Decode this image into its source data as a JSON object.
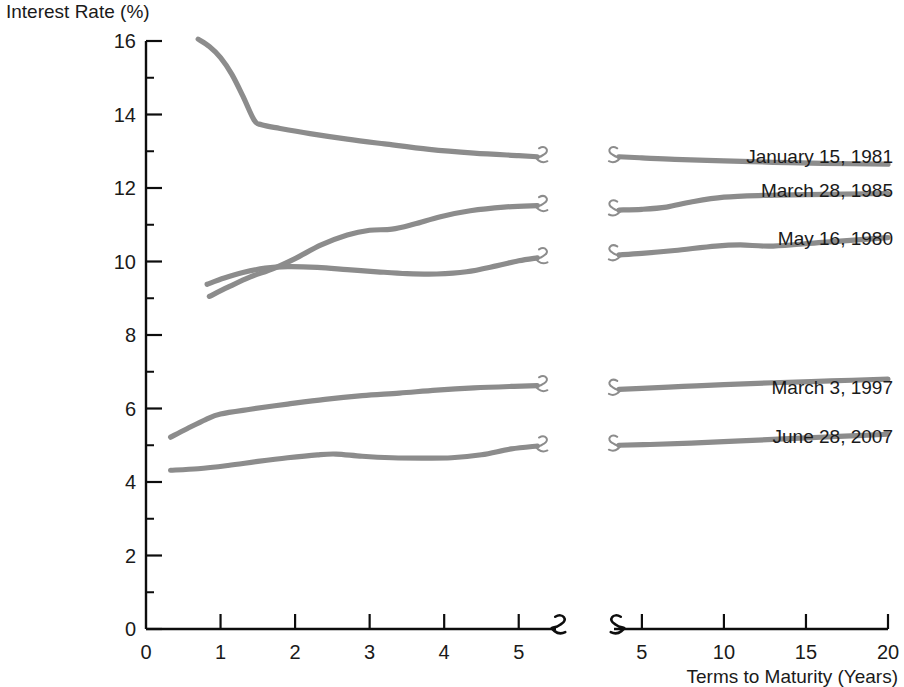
{
  "chart_data": {
    "type": "line",
    "title": "",
    "ylabel": "Interest Rate (%)",
    "xlabel": "Terms to Maturity (Years)",
    "ylim": [
      0,
      16
    ],
    "y_ticks": [
      0,
      2,
      4,
      6,
      8,
      10,
      12,
      14,
      16
    ],
    "y_tick_labels": [
      "0",
      "2",
      "4",
      "6",
      "8",
      "10",
      "12",
      "14",
      "16"
    ],
    "grid": false,
    "legend_position": "right-inline",
    "axis_break": true,
    "left_panel": {
      "xlim": [
        0,
        5.5
      ],
      "x_ticks": [
        0,
        1,
        2,
        3,
        4,
        5
      ],
      "x_tick_labels": [
        "0",
        "1",
        "2",
        "3",
        "4",
        "5"
      ]
    },
    "right_panel": {
      "xlim": [
        3.3,
        20
      ],
      "x_ticks": [
        5,
        10,
        15,
        20
      ],
      "x_tick_labels": [
        "5",
        "10",
        "15",
        "20"
      ]
    },
    "series": [
      {
        "name": "January 15, 1981",
        "color": "#8c8c8c",
        "label": "January 15, 1981",
        "left_points": [
          [
            0.7,
            16.05
          ],
          [
            0.85,
            15.85
          ],
          [
            1.0,
            15.55
          ],
          [
            1.15,
            15.1
          ],
          [
            1.3,
            14.5
          ],
          [
            1.45,
            13.85
          ],
          [
            1.55,
            13.72
          ],
          [
            1.8,
            13.62
          ],
          [
            2.2,
            13.48
          ],
          [
            2.7,
            13.33
          ],
          [
            3.2,
            13.2
          ],
          [
            3.8,
            13.05
          ],
          [
            4.4,
            12.95
          ],
          [
            5.0,
            12.88
          ],
          [
            5.25,
            12.85
          ]
        ],
        "right_points": [
          [
            3.6,
            12.85
          ],
          [
            5.0,
            12.82
          ],
          [
            7.0,
            12.78
          ],
          [
            10.0,
            12.74
          ],
          [
            13.0,
            12.7
          ],
          [
            16.0,
            12.67
          ],
          [
            20.0,
            12.65
          ]
        ]
      },
      {
        "name": "March 28, 1985",
        "color": "#8c8c8c",
        "label": "March 28, 1985",
        "left_points": [
          [
            0.85,
            9.05
          ],
          [
            1.1,
            9.3
          ],
          [
            1.4,
            9.58
          ],
          [
            1.7,
            9.8
          ],
          [
            2.0,
            10.08
          ],
          [
            2.35,
            10.45
          ],
          [
            2.7,
            10.72
          ],
          [
            3.0,
            10.85
          ],
          [
            3.3,
            10.88
          ],
          [
            3.6,
            11.02
          ],
          [
            3.95,
            11.22
          ],
          [
            4.35,
            11.38
          ],
          [
            4.8,
            11.48
          ],
          [
            5.25,
            11.52
          ]
        ],
        "right_points": [
          [
            3.6,
            11.4
          ],
          [
            5.0,
            11.42
          ],
          [
            6.5,
            11.48
          ],
          [
            8.0,
            11.62
          ],
          [
            10.0,
            11.75
          ],
          [
            12.5,
            11.8
          ],
          [
            15.0,
            11.82
          ],
          [
            20.0,
            11.85
          ]
        ]
      },
      {
        "name": "May 16, 1980",
        "color": "#8c8c8c",
        "label": "May 16, 1980",
        "left_points": [
          [
            0.82,
            9.38
          ],
          [
            1.05,
            9.55
          ],
          [
            1.3,
            9.7
          ],
          [
            1.6,
            9.82
          ],
          [
            1.9,
            9.86
          ],
          [
            2.3,
            9.84
          ],
          [
            2.7,
            9.78
          ],
          [
            3.1,
            9.72
          ],
          [
            3.5,
            9.67
          ],
          [
            3.9,
            9.66
          ],
          [
            4.3,
            9.72
          ],
          [
            4.7,
            9.88
          ],
          [
            5.0,
            10.02
          ],
          [
            5.25,
            10.1
          ]
        ],
        "right_points": [
          [
            3.6,
            10.18
          ],
          [
            5.0,
            10.22
          ],
          [
            7.0,
            10.3
          ],
          [
            9.5,
            10.42
          ],
          [
            11.0,
            10.45
          ],
          [
            13.0,
            10.42
          ],
          [
            16.0,
            10.52
          ],
          [
            20.0,
            10.65
          ]
        ]
      },
      {
        "name": "March 3, 1997",
        "color": "#8c8c8c",
        "label": "March 3, 1997",
        "left_points": [
          [
            0.33,
            5.22
          ],
          [
            0.55,
            5.45
          ],
          [
            0.8,
            5.7
          ],
          [
            1.0,
            5.85
          ],
          [
            1.4,
            5.98
          ],
          [
            1.9,
            6.12
          ],
          [
            2.4,
            6.25
          ],
          [
            2.9,
            6.35
          ],
          [
            3.4,
            6.42
          ],
          [
            3.9,
            6.5
          ],
          [
            4.4,
            6.56
          ],
          [
            4.9,
            6.6
          ],
          [
            5.25,
            6.62
          ]
        ],
        "right_points": [
          [
            3.6,
            6.52
          ],
          [
            5.0,
            6.55
          ],
          [
            7.5,
            6.6
          ],
          [
            10.0,
            6.65
          ],
          [
            13.0,
            6.7
          ],
          [
            16.5,
            6.75
          ],
          [
            20.0,
            6.8
          ]
        ]
      },
      {
        "name": "June 28, 2007",
        "color": "#8c8c8c",
        "label": "June 28, 2007",
        "left_points": [
          [
            0.33,
            4.32
          ],
          [
            0.7,
            4.36
          ],
          [
            1.1,
            4.45
          ],
          [
            1.5,
            4.56
          ],
          [
            1.9,
            4.66
          ],
          [
            2.3,
            4.74
          ],
          [
            2.55,
            4.76
          ],
          [
            2.9,
            4.7
          ],
          [
            3.3,
            4.66
          ],
          [
            3.7,
            4.65
          ],
          [
            4.1,
            4.66
          ],
          [
            4.5,
            4.74
          ],
          [
            4.9,
            4.9
          ],
          [
            5.25,
            4.98
          ]
        ],
        "right_points": [
          [
            3.6,
            5.0
          ],
          [
            5.5,
            5.02
          ],
          [
            8.0,
            5.06
          ],
          [
            11.0,
            5.12
          ],
          [
            14.0,
            5.18
          ],
          [
            17.0,
            5.24
          ],
          [
            20.0,
            5.3
          ]
        ]
      }
    ],
    "series_label_positions": [
      {
        "name": "January 15, 1981",
        "x": 920,
        "y": 163
      },
      {
        "name": "March 28, 1985",
        "x": 920,
        "y": 197
      },
      {
        "name": "May 16, 1980",
        "x": 920,
        "y": 245
      },
      {
        "name": "March 3, 1997",
        "x": 920,
        "y": 394
      },
      {
        "name": "June 28, 2007",
        "x": 920,
        "y": 443
      }
    ]
  }
}
